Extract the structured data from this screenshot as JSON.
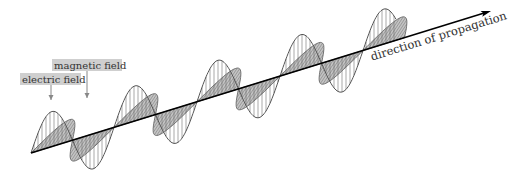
{
  "diagram": {
    "labels": {
      "electric_field": "electric field",
      "magnetic_field": "magnetic field",
      "direction": "direction of propagation"
    },
    "colors": {
      "axis": "#000000",
      "e_outline": "#555555",
      "e_hatch": "#6e6e6e",
      "b_fill": "#c4c4c4",
      "b_outline": "#666666",
      "b_hatch": "#7a7a7a",
      "label_box": "#cfcfcf",
      "label_text": "#333333",
      "pointer": "#888888"
    },
    "axis": {
      "x1": 31,
      "y1": 153,
      "x2": 491,
      "y2": 11
    },
    "wave": {
      "x_start": 31,
      "x_end": 396,
      "half_period_px": 41.5,
      "e_amplitude": 35,
      "b_vector": [
        20,
        -30
      ]
    },
    "label_boxes": [
      {
        "key": "magnetic_field",
        "x": 52,
        "y": 59,
        "w": 70,
        "h": 12,
        "pointer_x": 87,
        "pointer_y2": 98
      },
      {
        "key": "electric_field",
        "x": 20,
        "y": 73,
        "w": 61,
        "h": 12,
        "pointer_x": 51,
        "pointer_y2": 100
      }
    ]
  }
}
